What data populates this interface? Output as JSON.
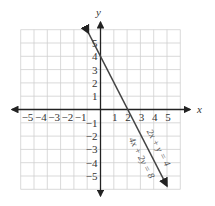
{
  "diagram": {
    "type": "coordinate-plane-graph",
    "axes": {
      "x_label": "x",
      "y_label": "y",
      "x_ticks": [
        "-5",
        "-4",
        "-3",
        "-2",
        "-1",
        "1",
        "2",
        "3",
        "4",
        "5"
      ],
      "y_ticks": [
        "5",
        "4",
        "3",
        "2",
        "1",
        "-1",
        "-2",
        "-3",
        "-4",
        "-5"
      ],
      "range": [
        -6,
        6
      ]
    },
    "line": {
      "equation_1": "2x + y = 4",
      "equation_2": "4x + 2y = 8",
      "y_intercept": 4,
      "x_intercept": 2,
      "color": "#444444"
    },
    "grid_color": "#cfcfcf",
    "axis_color": "#222222"
  }
}
